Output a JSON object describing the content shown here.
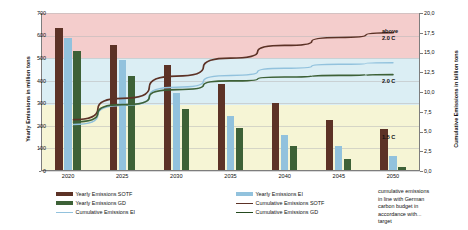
{
  "chart_data": {
    "type": "bar",
    "title": "",
    "subtitle": "",
    "xlabel": "",
    "ylabel": "Yearly Emissions in million tons",
    "ylabel_secondary": "Cumulative Emissions in billion tons",
    "categories": [
      "2020",
      "2025",
      "2030",
      "2035",
      "2040",
      "2045",
      "2050"
    ],
    "ylim": [
      0,
      700
    ],
    "yticks": [
      "0",
      "100",
      "200",
      "300",
      "400",
      "500",
      "600",
      "700"
    ],
    "ylim_secondary": [
      0,
      20
    ],
    "yticks_secondary": [
      "0,0",
      "2,5",
      "5,0",
      "7,5",
      "10,0",
      "12,5",
      "15,0",
      "17,5",
      "20,0"
    ],
    "grid": true,
    "legend_position": "bottom",
    "series": [
      {
        "name": "Yearly Emissions SOTF",
        "kind": "bar",
        "axis": "left",
        "color": "#5c3226",
        "values": [
          635,
          560,
          470,
          385,
          300,
          225,
          185
        ]
      },
      {
        "name": "Yearly Emissions EI",
        "kind": "bar",
        "axis": "left",
        "color": "#92c2dd",
        "values": [
          588,
          490,
          345,
          245,
          160,
          110,
          65
        ]
      },
      {
        "name": "Yearly Emissions GD",
        "kind": "bar",
        "axis": "left",
        "color": "#3d6137",
        "values": [
          533,
          420,
          275,
          190,
          110,
          55,
          20
        ]
      },
      {
        "name": "Cumulative Emissions SOTF",
        "kind": "line",
        "axis": "right",
        "color": "#5c3226",
        "x": [
          "2021",
          "2025",
          "2030",
          "2035",
          "2040",
          "2045",
          "2050"
        ],
        "values": [
          6.5,
          9.2,
          12.0,
          14.3,
          15.9,
          16.9,
          17.5
        ]
      },
      {
        "name": "Cumulative Emissions EI",
        "kind": "line",
        "axis": "right",
        "color": "#92c2dd",
        "values": [
          5.9,
          8.3,
          10.6,
          12.1,
          13.0,
          13.5,
          13.7
        ]
      },
      {
        "name": "Cumulative Emissions GD",
        "kind": "line",
        "axis": "right",
        "color": "#3d6137",
        "values": [
          6.2,
          8.4,
          10.3,
          11.4,
          11.9,
          12.1,
          12.2
        ]
      }
    ],
    "bands": [
      {
        "label": "above\n2.0 C",
        "label_line1": "above",
        "label_line2": "2.0 C",
        "color": "#f4cdcc",
        "from": 14.3,
        "to": 20.0
      },
      {
        "label": "2.0 C",
        "label_line1": "2.0 C",
        "label_line2": "",
        "color": "#dbeef4",
        "from": 8.3,
        "to": 14.3
      },
      {
        "label": "1.5 C",
        "label_line1": "1.5 C",
        "label_line2": "",
        "color": "#f6f5d5",
        "from": 0.0,
        "to": 8.3
      }
    ],
    "annotation": {
      "line1": "cumulative emissions",
      "line2": "in line with German",
      "line3": "carbon budget in",
      "line4": "accordance with...",
      "line5": "target"
    }
  },
  "legend": {
    "items": [
      {
        "label": "Yearly Emissions SOTF",
        "color": "#5c3226",
        "kind": "bar"
      },
      {
        "label": "Yearly Emissions GD",
        "color": "#3d6137",
        "kind": "bar"
      },
      {
        "label": "Cumulative Emissions EI",
        "color": "#92c2dd",
        "kind": "line"
      },
      {
        "label": "Yearly Emissions EI",
        "color": "#92c2dd",
        "kind": "bar"
      },
      {
        "label": "Cumulative Emissions SOTF",
        "color": "#5c3226",
        "kind": "line"
      },
      {
        "label": "Cumulative Emissions GD",
        "color": "#254a1f",
        "kind": "line"
      }
    ]
  }
}
